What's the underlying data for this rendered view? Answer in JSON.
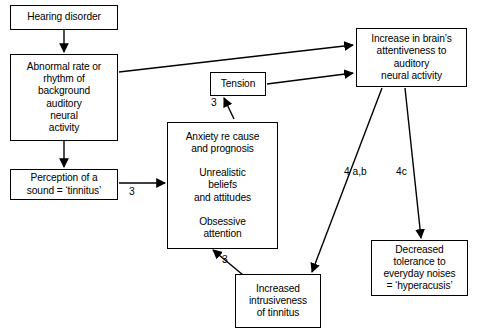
{
  "diagram": {
    "type": "flowchart",
    "background": "#ffffff",
    "stroke": "#000000",
    "nodes": [
      {
        "id": "hearing",
        "label": "Hearing disorder"
      },
      {
        "id": "abnormal",
        "label": "Abnormal rate or\nrhythm of\nbackground\nauditory\nneural\nactivity"
      },
      {
        "id": "perception",
        "label": "Perception of a\nsound = ‘tinnitus’"
      },
      {
        "id": "tension",
        "label": "Tension"
      },
      {
        "id": "anxiety",
        "label": "Anxiety re cause\nand prognosis\n\nUnrealistic\nbeliefs\nand attitudes\n\nObsessive\nattention"
      },
      {
        "id": "brain",
        "label": "Increase in brain’s\nattentiveness to\nauditory\nneural activity"
      },
      {
        "id": "intrusive",
        "label": "Increased\nintrusiveness\nof tinnitus"
      },
      {
        "id": "decreased",
        "label": "Decreased\ntolerance to\neveryday noises\n= ‘hyperacusis’"
      }
    ],
    "edge_labels": {
      "anxiety_to_tension": "3",
      "perception_to_anxiety": "3",
      "intrusive_to_anxiety": "3",
      "brain_to_intrusive": "4 a,b",
      "brain_to_decreased": "4c"
    }
  }
}
